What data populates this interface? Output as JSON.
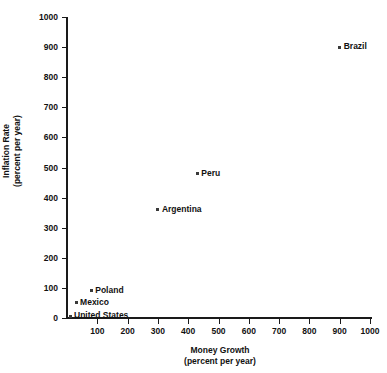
{
  "chart_data": {
    "type": "scatter",
    "title": "",
    "xlabel": "Money Growth",
    "xlabel_units": "(percent per year)",
    "ylabel": "Inflation Rate",
    "ylabel_units": "(percent per year)",
    "xlim": [
      0,
      1050
    ],
    "ylim": [
      0,
      1020
    ],
    "xticks": [
      100,
      200,
      300,
      400,
      500,
      600,
      700,
      800,
      900,
      1000
    ],
    "yticks": [
      0,
      100,
      200,
      300,
      400,
      500,
      600,
      700,
      800,
      900,
      1000
    ],
    "grid": false,
    "legend": "none",
    "marker_color": "#3a3a3a",
    "axis_color": "#1a1a1a",
    "points": [
      {
        "label": "Brazil",
        "x": 900,
        "y": 900,
        "label_pos": "right"
      },
      {
        "label": "Peru",
        "x": 430,
        "y": 480,
        "label_pos": "right"
      },
      {
        "label": "Argentina",
        "x": 300,
        "y": 360,
        "label_pos": "right"
      },
      {
        "label": "Poland",
        "x": 80,
        "y": 90,
        "label_pos": "right"
      },
      {
        "label": "Mexico",
        "x": 30,
        "y": 50,
        "label_pos": "right"
      },
      {
        "label": "United States",
        "x": 10,
        "y": 5,
        "label_pos": "right"
      }
    ]
  }
}
